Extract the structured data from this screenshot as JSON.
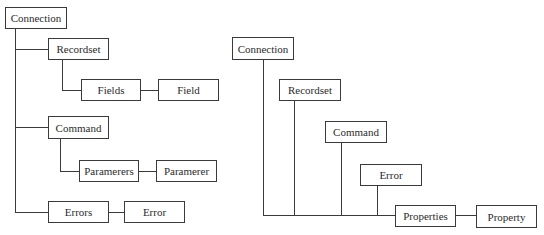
{
  "left_tree": {
    "connection": "Connection",
    "recordset": "Recordset",
    "fields": "Fields",
    "field": "Field",
    "command": "Command",
    "parameters": "Paramerers",
    "parameter": "Paramerer",
    "errors": "Errors",
    "error": "Error"
  },
  "right_tree": {
    "connection": "Connection",
    "recordset": "Recordset",
    "command": "Command",
    "error": "Error",
    "properties": "Properties",
    "property": "Property"
  },
  "colors": {
    "line": "#3a3a3a",
    "text": "#2b2b2b",
    "background": "#ffffff"
  }
}
